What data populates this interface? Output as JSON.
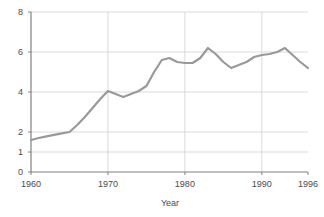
{
  "chart_data": {
    "type": "line",
    "title": "",
    "subtitle": "",
    "xlabel": "Year",
    "ylabel": "",
    "xlim": [
      1960,
      1996
    ],
    "ylim": [
      0,
      8
    ],
    "grid": true,
    "legend": null,
    "line_color": "#999999",
    "axis_color": "#808080",
    "grid_color": "#cccccc",
    "text_color": "#4a4a4a",
    "background": "#ffffff",
    "x_ticks": [
      1960,
      1970,
      1980,
      1990,
      1996
    ],
    "x_tick_labels": [
      "1960",
      "1970",
      "1980",
      "1990",
      "1996"
    ],
    "y_ticks": [
      0,
      1,
      2,
      4,
      6,
      8
    ],
    "y_tick_labels": [
      "0",
      "1",
      "2",
      "4",
      "6",
      "8"
    ],
    "y_gridlines": [
      1,
      2,
      4,
      6,
      8
    ],
    "series": [
      {
        "name": "value",
        "x": [
          1960,
          1961,
          1962,
          1963,
          1964,
          1965,
          1966,
          1967,
          1968,
          1969,
          1970,
          1971,
          1972,
          1973,
          1974,
          1975,
          1976,
          1977,
          1978,
          1979,
          1980,
          1981,
          1982,
          1983,
          1984,
          1985,
          1986,
          1987,
          1988,
          1989,
          1990,
          1991,
          1992,
          1993,
          1994,
          1995,
          1996
        ],
        "values": [
          1.6,
          1.7,
          1.78,
          1.86,
          1.93,
          2.0,
          2.35,
          2.75,
          3.2,
          3.65,
          4.05,
          3.9,
          3.75,
          3.9,
          4.05,
          4.3,
          5.0,
          5.6,
          5.7,
          5.5,
          5.45,
          5.45,
          5.7,
          6.2,
          5.9,
          5.5,
          5.2,
          5.35,
          5.5,
          5.75,
          5.85,
          5.9,
          6.0,
          6.2,
          5.85,
          5.5,
          5.2
        ]
      }
    ]
  },
  "axis": {
    "x_title": "Year"
  }
}
